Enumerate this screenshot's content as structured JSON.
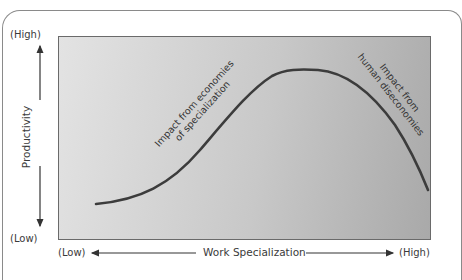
{
  "diagram": {
    "type": "curve",
    "y_axis": {
      "title": "Productivity",
      "high_label": "(High)",
      "low_label": "(Low)"
    },
    "x_axis": {
      "title": "Work Specialization",
      "low_label": "(Low)",
      "high_label": "(High)"
    },
    "annotations": {
      "rising": {
        "line1": "Impact from economies",
        "line2": "of specialization"
      },
      "falling": {
        "line1": "Impact from",
        "line2": "human diseconomies"
      }
    },
    "colors": {
      "curve": "#3c3c3c",
      "plot_bg_light": "#e3e3e3",
      "plot_bg_dark": "#a9a9a9",
      "text": "#3a3a3a"
    }
  }
}
